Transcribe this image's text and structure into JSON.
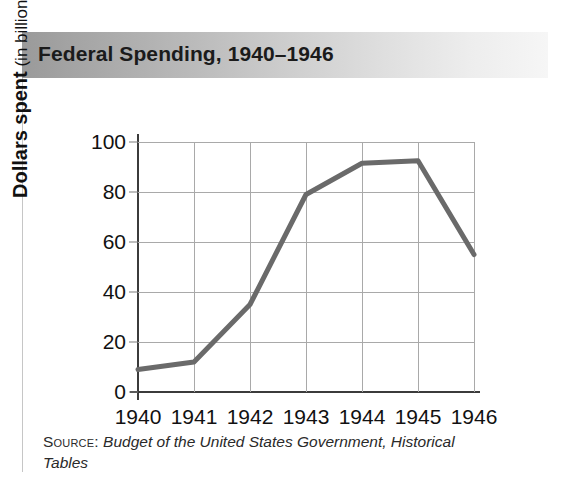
{
  "figure": {
    "title": "Federal Spending, 1940–1946",
    "source_label": "Source:",
    "source_citation": "Budget of the United States Government, Historical Tables",
    "y_axis_title_main": "Dollars spent",
    "y_axis_title_unit": "(in billions)",
    "colors": {
      "line": "#6a6a6a",
      "grid": "#a9a9a9",
      "axis": "#3b3b3b",
      "title_bar_dark": "#9a9a9a",
      "title_bar_light": "#f6f6f6",
      "text": "#111111"
    }
  },
  "chart_data": {
    "type": "line",
    "title": "Federal Spending, 1940–1946",
    "subtitle": "",
    "xlabel": "",
    "ylabel": "Dollars spent (in billions)",
    "categories": [
      "1940",
      "1941",
      "1942",
      "1943",
      "1944",
      "1945",
      "1946"
    ],
    "x": [
      1940,
      1941,
      1942,
      1943,
      1944,
      1945,
      1946
    ],
    "values": [
      9,
      12,
      35,
      79,
      91.5,
      92.5,
      55
    ],
    "series": [
      {
        "name": "Federal spending",
        "values": [
          9,
          12,
          35,
          79,
          91.5,
          92.5,
          55
        ]
      }
    ],
    "ylim": [
      0,
      100
    ],
    "yticks": [
      0,
      20,
      40,
      60,
      80,
      100
    ],
    "ytick_labels": [
      "0",
      "20",
      "40",
      "60",
      "80",
      "100"
    ],
    "xtick_labels": [
      "1940",
      "1941",
      "1942",
      "1943",
      "1944",
      "1945",
      "1946"
    ],
    "grid": true,
    "legend": false,
    "legend_position": "none",
    "annotations": [],
    "source": "Budget of the United States Government, Historical Tables"
  }
}
